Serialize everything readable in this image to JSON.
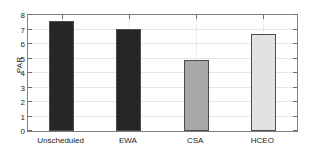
{
  "chart_data": {
    "type": "bar",
    "title": "",
    "xlabel": "",
    "ylabel": "PAR",
    "categories": [
      "Unscheduled",
      "EWA",
      "CSA",
      "HCEO"
    ],
    "values": [
      7.6,
      7.05,
      4.88,
      6.7
    ],
    "bar_colors": [
      "#262626",
      "#262626",
      "#a8a8a8",
      "#e2e2e2"
    ],
    "bar_edge_color": "#4d4d4d",
    "ylim": [
      0,
      8
    ],
    "yticks": [
      0,
      1,
      2,
      3,
      4,
      5,
      6,
      7,
      8
    ],
    "ytick_labels": [
      "0",
      "1",
      "2",
      "3",
      "4",
      "5",
      "6",
      "7",
      "8"
    ],
    "grid": true,
    "grid_color": "#e6e6e6",
    "legend": null,
    "legend_position": "none",
    "axis_color": "#808080",
    "background_color": "#ffffff",
    "bars": [
      {
        "label": "Unscheduled",
        "value": 7.6,
        "color": "#262626"
      },
      {
        "label": "EWA",
        "value": 7.05,
        "color": "#262626"
      },
      {
        "label": "CSA",
        "value": 4.88,
        "color": "#a8a8a8"
      },
      {
        "label": "HCEO",
        "value": 6.7,
        "color": "#e2e2e2"
      }
    ]
  }
}
